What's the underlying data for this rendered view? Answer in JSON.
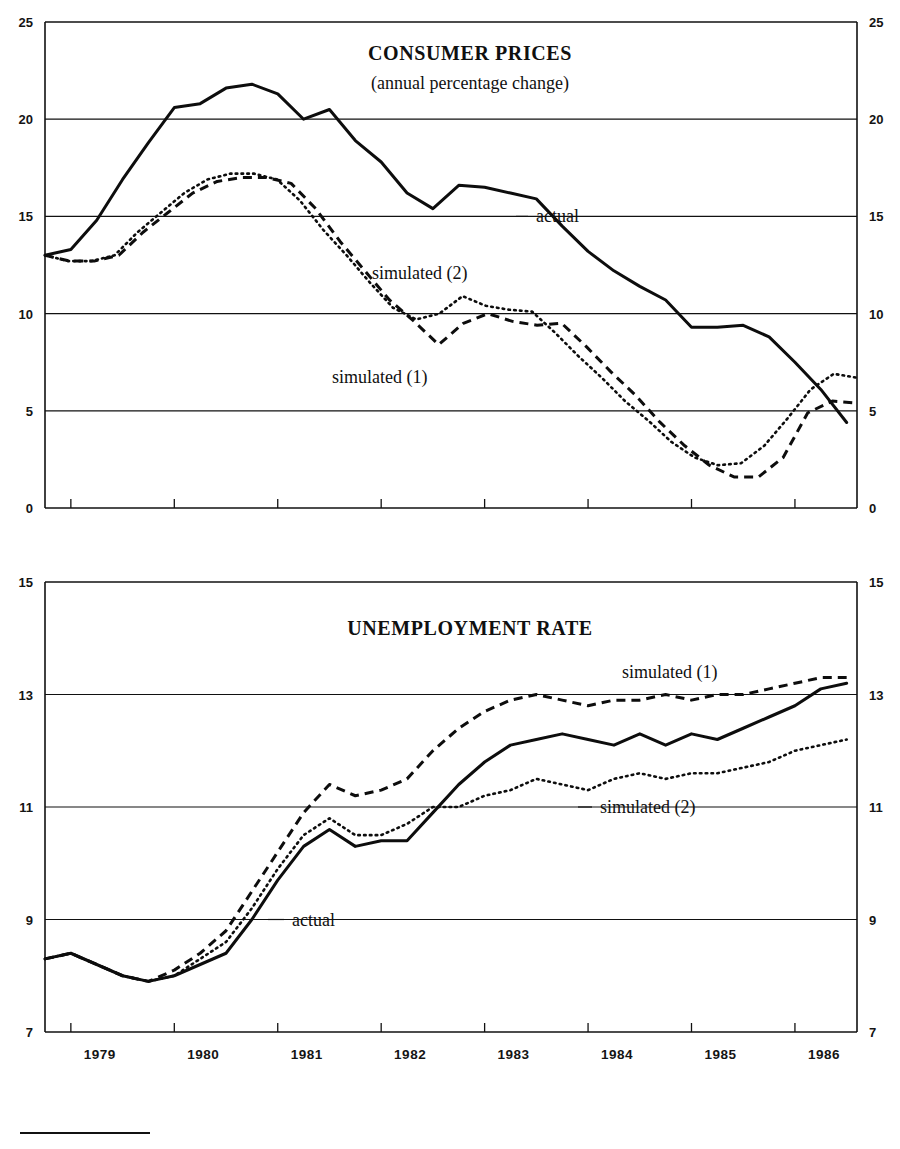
{
  "figure": {
    "background": "#ffffff",
    "ink_color": "#111111",
    "footnote_rule": true
  },
  "chart_data": [
    {
      "id": "consumer-prices",
      "type": "line",
      "title": "CONSUMER PRICES",
      "subtitle": "(annual percentage change)",
      "xlabel": "",
      "ylabel": "",
      "ylim": [
        0,
        25
      ],
      "yticks": [
        0,
        5,
        10,
        15,
        20,
        25
      ],
      "ytick_labels": [
        "0",
        "5",
        "10",
        "15",
        "20",
        "25"
      ],
      "right_axis_mirrored": true,
      "grid": true,
      "grid_axis": "y",
      "legend_position": "inline-annotations",
      "xlim": [
        "1978.75",
        "1986.6"
      ],
      "xticks": [
        1979,
        1980,
        1981,
        1982,
        1983,
        1984,
        1985,
        1986
      ],
      "xtick_labels": [
        "1979",
        "1980",
        "1981",
        "1982",
        "1983",
        "1984",
        "1985",
        "1986"
      ],
      "x": [
        1978.75,
        1979.0,
        1979.25,
        1979.5,
        1979.75,
        1980.0,
        1980.25,
        1980.5,
        1980.75,
        1981.0,
        1981.25,
        1981.5,
        1981.75,
        1982.0,
        1982.25,
        1982.5,
        1982.75,
        1983.0,
        1983.25,
        1983.5,
        1983.75,
        1984.0,
        1984.25,
        1984.5,
        1984.75,
        1985.0,
        1985.25,
        1985.5,
        1985.75,
        1986.0,
        1986.25,
        1986.5
      ],
      "series": [
        {
          "name": "actual",
          "style": "solid",
          "values": [
            13.0,
            13.3,
            14.8,
            16.9,
            18.8,
            20.6,
            20.8,
            21.6,
            21.8,
            21.3,
            20.0,
            20.5,
            18.9,
            17.8,
            16.2,
            15.4,
            16.6,
            16.5,
            16.2,
            15.9,
            14.5,
            13.2,
            12.2,
            11.4,
            10.7,
            9.3,
            9.3,
            9.4,
            8.8,
            7.5,
            6.1,
            4.4
          ]
        },
        {
          "name": "simulated (1)",
          "style": "dashed",
          "values": [
            13.0,
            12.7,
            12.7,
            13.0,
            14.2,
            15.2,
            16.2,
            16.8,
            17.0,
            17.0,
            16.7,
            15.4,
            13.7,
            12.2,
            10.7,
            9.6,
            8.4,
            9.5,
            10.0,
            9.6,
            9.4,
            9.5,
            8.3,
            7.0,
            5.8,
            4.4,
            3.2,
            2.2,
            1.6,
            1.6,
            2.6,
            4.9,
            5.5,
            5.4
          ]
        },
        {
          "name": "simulated (2)",
          "style": "dotted",
          "values": [
            13.0,
            12.7,
            12.7,
            13.0,
            14.2,
            15.2,
            16.2,
            16.9,
            17.2,
            17.2,
            16.9,
            15.8,
            14.3,
            13.0,
            11.6,
            10.3,
            9.7,
            10.0,
            10.9,
            10.4,
            10.2,
            10.1,
            9.0,
            7.8,
            6.7,
            5.5,
            4.5,
            3.4,
            2.6,
            2.2,
            2.3,
            3.2,
            4.6,
            6.1,
            6.9,
            6.7
          ]
        }
      ],
      "annotations": [
        {
          "text": "actual",
          "value": 15,
          "note": "label on 15 gridline, right of solid curve"
        },
        {
          "text": "simulated (2)",
          "value": 12.3,
          "note": "label above dotted curve"
        },
        {
          "text": "simulated (1)",
          "value": 7.5,
          "note": "label below dashed curve"
        }
      ]
    },
    {
      "id": "unemployment-rate",
      "type": "line",
      "title": "UNEMPLOYMENT RATE",
      "subtitle": "",
      "xlabel": "",
      "ylabel": "",
      "ylim": [
        7,
        15
      ],
      "yticks": [
        7,
        9,
        11,
        13,
        15
      ],
      "ytick_labels": [
        "7",
        "9",
        "11",
        "13",
        "15"
      ],
      "right_axis_mirrored": true,
      "grid": true,
      "grid_axis": "y",
      "legend_position": "inline-annotations",
      "xlim": [
        "1978.75",
        "1986.6"
      ],
      "xticks": [
        1979,
        1980,
        1981,
        1982,
        1983,
        1984,
        1985,
        1986
      ],
      "xtick_labels": [
        "1979",
        "1980",
        "1981",
        "1982",
        "1983",
        "1984",
        "1985",
        "1986"
      ],
      "x": [
        1978.75,
        1979.0,
        1979.25,
        1979.5,
        1979.75,
        1980.0,
        1980.25,
        1980.5,
        1980.75,
        1981.0,
        1981.25,
        1981.5,
        1981.75,
        1982.0,
        1982.25,
        1982.5,
        1982.75,
        1983.0,
        1983.25,
        1983.5,
        1983.75,
        1984.0,
        1984.25,
        1984.5,
        1984.75,
        1985.0,
        1985.25,
        1985.5,
        1985.75,
        1986.0,
        1986.25,
        1986.5
      ],
      "series": [
        {
          "name": "actual",
          "style": "solid",
          "values": [
            8.3,
            8.4,
            8.2,
            8.0,
            7.9,
            8.0,
            8.2,
            8.4,
            9.0,
            9.7,
            10.3,
            10.6,
            10.3,
            10.4,
            10.4,
            10.9,
            11.4,
            11.8,
            12.1,
            12.2,
            12.3,
            12.2,
            12.1,
            12.3,
            12.1,
            12.3,
            12.2,
            12.4,
            12.6,
            12.8,
            13.1,
            13.2
          ]
        },
        {
          "name": "simulated (1)",
          "style": "dashed",
          "values": [
            8.3,
            8.4,
            8.2,
            8.0,
            7.9,
            8.1,
            8.4,
            8.8,
            9.5,
            10.2,
            10.9,
            11.4,
            11.2,
            11.3,
            11.5,
            12.0,
            12.4,
            12.7,
            12.9,
            13.0,
            12.9,
            12.8,
            12.9,
            12.9,
            13.0,
            12.9,
            13.0,
            13.0,
            13.1,
            13.2,
            13.3,
            13.3
          ]
        },
        {
          "name": "simulated (2)",
          "style": "dotted",
          "values": [
            8.3,
            8.4,
            8.2,
            8.0,
            7.9,
            8.0,
            8.3,
            8.6,
            9.2,
            9.9,
            10.5,
            10.8,
            10.5,
            10.5,
            10.7,
            11.0,
            11.0,
            11.2,
            11.3,
            11.5,
            11.4,
            11.3,
            11.5,
            11.6,
            11.5,
            11.6,
            11.6,
            11.7,
            11.8,
            12.0,
            12.1,
            12.2
          ]
        }
      ],
      "annotations": [
        {
          "text": "simulated (1)",
          "value": 13.8,
          "note": "label above dashed curve"
        },
        {
          "text": "simulated (2)",
          "value": 11,
          "note": "label on 11 gridline"
        },
        {
          "text": "actual",
          "value": 9,
          "note": "label on 9 gridline"
        }
      ]
    }
  ]
}
